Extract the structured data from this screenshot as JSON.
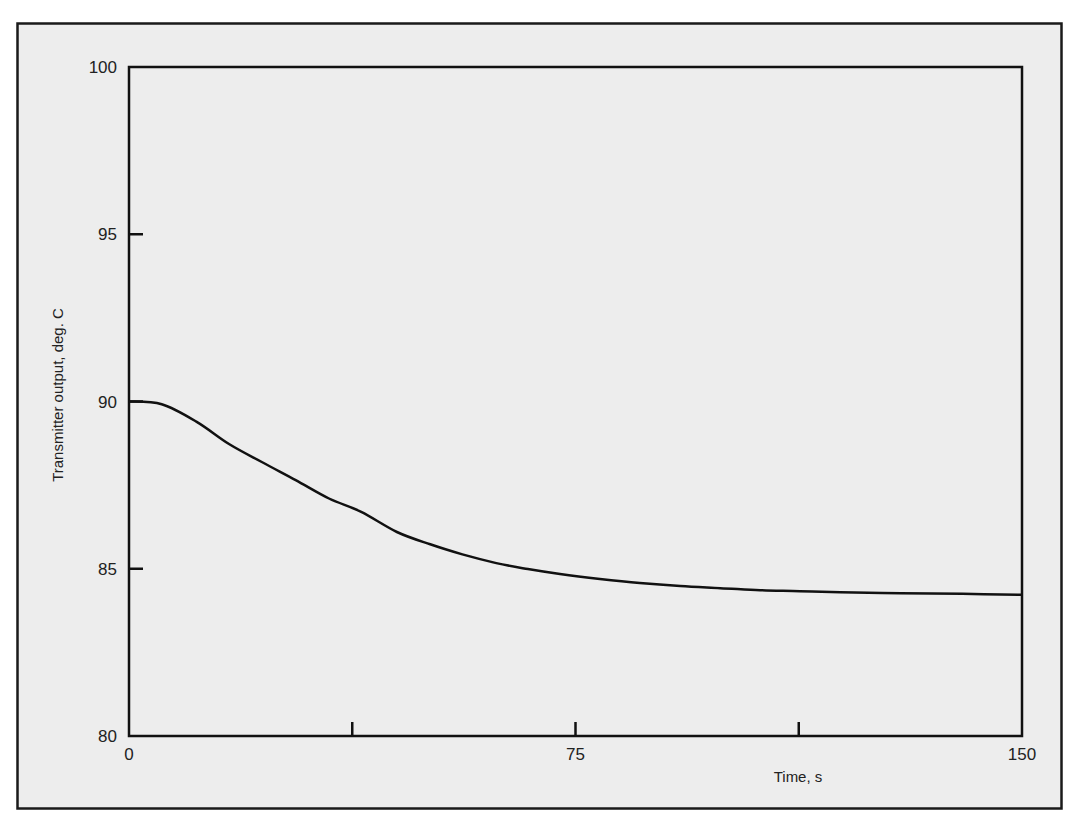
{
  "chart_data": {
    "type": "line",
    "title": "",
    "xlabel": "Time, s",
    "ylabel": "Transmitter output, deg. C",
    "xlim": [
      0,
      150
    ],
    "ylim": [
      80,
      100
    ],
    "x_ticks": [
      0,
      37.5,
      75,
      112.5,
      150
    ],
    "x_tick_labels": [
      "0",
      "",
      "75",
      "",
      "150"
    ],
    "y_ticks": [
      80,
      85,
      90,
      95,
      100
    ],
    "y_tick_labels": [
      "80",
      "85",
      "90",
      "95",
      "100"
    ],
    "grid": false,
    "legend": null,
    "series": [
      {
        "name": "Transmitter output",
        "color": "#111111",
        "x": [
          0,
          5.5,
          11.3,
          16.8,
          22.3,
          28,
          33.6,
          39,
          45,
          50.6,
          56,
          61.7,
          67,
          72.4,
          79.1,
          85.8,
          92.6,
          99.3,
          106,
          112.7,
          119.5,
          129.6,
          140,
          150
        ],
        "y": [
          90.0,
          89.92,
          89.4,
          88.73,
          88.19,
          87.65,
          87.1,
          86.7,
          86.1,
          85.73,
          85.43,
          85.17,
          84.99,
          84.84,
          84.69,
          84.57,
          84.48,
          84.42,
          84.36,
          84.33,
          84.3,
          84.27,
          84.25,
          84.22
        ]
      }
    ]
  },
  "colors": {
    "frame_background": "#ededed",
    "page_background": "#ffffff",
    "ink": "#111111"
  }
}
